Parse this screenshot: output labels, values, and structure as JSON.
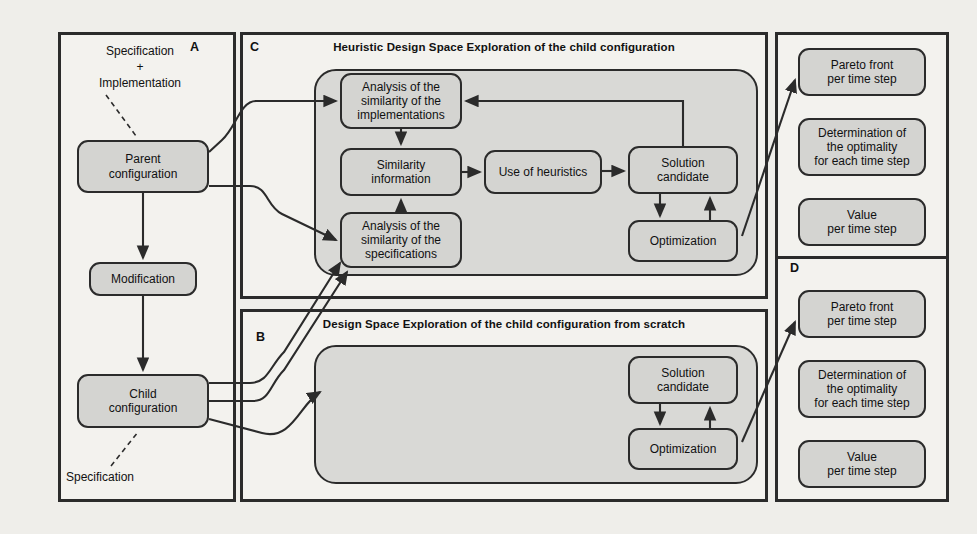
{
  "figure": {
    "type": "flow-diagram",
    "background_color": "#efeeea",
    "node_fill": "#d4d4d1",
    "group_fill": "#d9d9d6",
    "stroke_color": "#2b2b2b"
  },
  "panels": {
    "a": {
      "letter": "A",
      "title": "",
      "annotation_top": "Specification\n+\nImplementation",
      "annotation_top_line1": "Specification",
      "annotation_top_line2": "+",
      "annotation_top_line3": "Implementation",
      "annotation_bottom": "Specification",
      "nodes": [
        {
          "id": "parent-configuration",
          "label_line1": "Parent",
          "label_line2": "configuration"
        },
        {
          "id": "modification",
          "label_line1": "Modification",
          "label_line2": ""
        },
        {
          "id": "child-configuration",
          "label_line1": "Child",
          "label_line2": "configuration"
        }
      ]
    },
    "c": {
      "letter": "C",
      "title": "Heuristic Design Space Exploration of the child configuration",
      "nodes": [
        {
          "id": "analysis-implementations",
          "label_line1": "Analysis of the",
          "label_line2": "similarity of the",
          "label_line3": "implementations"
        },
        {
          "id": "similarity-information",
          "label_line1": "Similarity",
          "label_line2": "information",
          "label_line3": ""
        },
        {
          "id": "analysis-specifications",
          "label_line1": "Analysis of the",
          "label_line2": "similarity of the",
          "label_line3": "specifications"
        },
        {
          "id": "use-of-heuristics",
          "label_line1": "Use of heuristics",
          "label_line2": "",
          "label_line3": ""
        },
        {
          "id": "solution-candidate-c",
          "label_line1": "Solution",
          "label_line2": "candidate",
          "label_line3": ""
        },
        {
          "id": "optimization-c",
          "label_line1": "Optimization",
          "label_line2": "",
          "label_line3": ""
        }
      ]
    },
    "b": {
      "letter": "B",
      "title": "Design Space Exploration of the child configuration from scratch",
      "nodes": [
        {
          "id": "solution-candidate-b",
          "label_line1": "Solution",
          "label_line2": "candidate"
        },
        {
          "id": "optimization-b",
          "label_line1": "Optimization",
          "label_line2": ""
        }
      ]
    },
    "d_top": {
      "letter": "",
      "title": "",
      "nodes": [
        {
          "id": "pareto-front-top",
          "label_line1": "Pareto front",
          "label_line2": "per time step",
          "label_line3": ""
        },
        {
          "id": "determination-top",
          "label_line1": "Determination of",
          "label_line2": "the optimality",
          "label_line3": "for each time step"
        },
        {
          "id": "value-top",
          "label_line1": "Value",
          "label_line2": "per time step",
          "label_line3": ""
        }
      ]
    },
    "d_bottom": {
      "letter": "D",
      "title": "",
      "nodes": [
        {
          "id": "pareto-front-bottom",
          "label_line1": "Pareto front",
          "label_line2": "per time step",
          "label_line3": ""
        },
        {
          "id": "determination-bottom",
          "label_line1": "Determination of",
          "label_line2": "the optimality",
          "label_line3": "for each time step"
        },
        {
          "id": "value-bottom",
          "label_line1": "Value",
          "label_line2": "per time step",
          "label_line3": ""
        }
      ]
    }
  }
}
